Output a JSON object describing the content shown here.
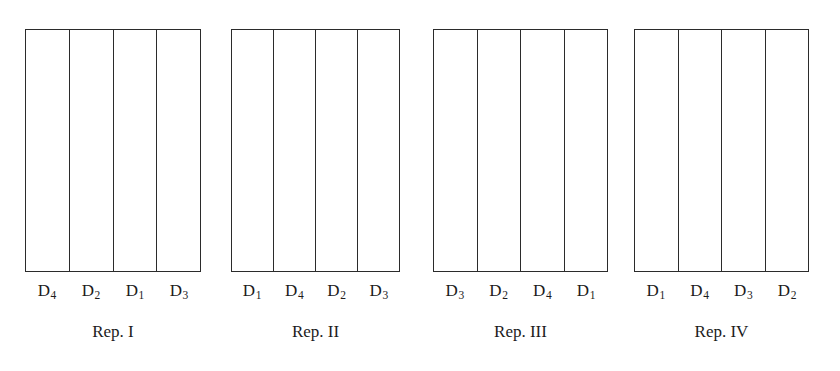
{
  "figure": {
    "type": "field-trial-layout-diagram",
    "background_color": "#ffffff",
    "line_color": "#2b2b2b",
    "text_color": "#1c1c1c",
    "block_count": 4,
    "plots_per_block": 4
  },
  "blocks": [
    {
      "caption": "Rep. I",
      "left": 25,
      "width": 176,
      "plots": [
        {
          "label_base": "D",
          "label_sub": "4",
          "label": "D4"
        },
        {
          "label_base": "D",
          "label_sub": "2",
          "label": "D2"
        },
        {
          "label_base": "D",
          "label_sub": "1",
          "label": "D1"
        },
        {
          "label_base": "D",
          "label_sub": "3",
          "label": "D3"
        }
      ]
    },
    {
      "caption": "Rep. II",
      "left": 231,
      "width": 169,
      "plots": [
        {
          "label_base": "D",
          "label_sub": "1",
          "label": "D1"
        },
        {
          "label_base": "D",
          "label_sub": "4",
          "label": "D4"
        },
        {
          "label_base": "D",
          "label_sub": "2",
          "label": "D2"
        },
        {
          "label_base": "D",
          "label_sub": "3",
          "label": "D3"
        }
      ]
    },
    {
      "caption": "Rep. III",
      "left": 433,
      "width": 175,
      "plots": [
        {
          "label_base": "D",
          "label_sub": "3",
          "label": "D3"
        },
        {
          "label_base": "D",
          "label_sub": "2",
          "label": "D2"
        },
        {
          "label_base": "D",
          "label_sub": "4",
          "label": "D4"
        },
        {
          "label_base": "D",
          "label_sub": "1",
          "label": "D1"
        }
      ]
    },
    {
      "caption": "Rep. IV",
      "left": 634,
      "width": 175,
      "plots": [
        {
          "label_base": "D",
          "label_sub": "1",
          "label": "D1"
        },
        {
          "label_base": "D",
          "label_sub": "4",
          "label": "D4"
        },
        {
          "label_base": "D",
          "label_sub": "3",
          "label": "D3"
        },
        {
          "label_base": "D",
          "label_sub": "2",
          "label": "D2"
        }
      ]
    }
  ]
}
